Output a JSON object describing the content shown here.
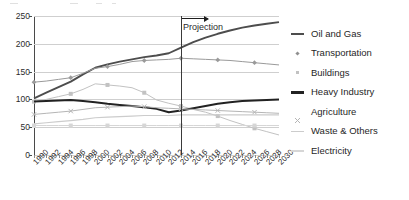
{
  "chart_data": {
    "type": "line",
    "title": "",
    "subtitle": "",
    "xlabel": "",
    "ylabel": "",
    "xlim": [
      1990,
      2030
    ],
    "ylim": [
      0,
      250
    ],
    "yticks": [
      0,
      50,
      100,
      150,
      200,
      250
    ],
    "grid": true,
    "legend_position": "right",
    "x": [
      1990,
      1992,
      1994,
      1996,
      1998,
      2000,
      2002,
      2004,
      2006,
      2008,
      2010,
      2012,
      2014,
      2016,
      2018,
      2020,
      2022,
      2024,
      2026,
      2028,
      2030
    ],
    "categories": [
      "1990",
      "1992",
      "1994",
      "1996",
      "1998",
      "2000",
      "2002",
      "2004",
      "2006",
      "2008",
      "2010",
      "2012",
      "2014",
      "2016",
      "2018",
      "2020",
      "2022",
      "2024",
      "2026",
      "2028",
      "2030"
    ],
    "annotations": [
      {
        "text": "Projection",
        "x": 2014,
        "type": "vertical-divider-with-arrow",
        "arrow_direction": "right"
      }
    ],
    "series": [
      {
        "name": "Oil and Gas",
        "marker": "none",
        "style": "line",
        "color": "#4d4d4d",
        "width": 1.9,
        "values": [
          102,
          112,
          122,
          132,
          145,
          157,
          163,
          168,
          172,
          176,
          179,
          183,
          193,
          203,
          211,
          218,
          224,
          229,
          233,
          236,
          239
        ]
      },
      {
        "name": "Transportation",
        "marker": "diamond",
        "style": "line-marker",
        "color": "#9a9a9a",
        "width": 1.0,
        "values": [
          131,
          133,
          136,
          139,
          147,
          156,
          159,
          163,
          168,
          170,
          171,
          172,
          174,
          173,
          172,
          171,
          170,
          168,
          166,
          164,
          162
        ]
      },
      {
        "name": "Buildings",
        "marker": "square",
        "style": "line-marker",
        "color": "#c2c2c2",
        "width": 1.0,
        "values": [
          96,
          100,
          105,
          110,
          118,
          128,
          126,
          124,
          121,
          112,
          99,
          93,
          88,
          82,
          77,
          70,
          62,
          55,
          48,
          42,
          36
        ]
      },
      {
        "name": "Heavy Industry",
        "marker": "none",
        "style": "line",
        "color": "#222222",
        "width": 2.0,
        "values": [
          96,
          97,
          98,
          99,
          97,
          95,
          92,
          90,
          88,
          86,
          83,
          77,
          80,
          84,
          88,
          92,
          95,
          97,
          98,
          99,
          100
        ]
      },
      {
        "name": "Agriculture",
        "marker": "cross",
        "style": "line-marker",
        "color": "#b5b5b5",
        "width": 1.0,
        "values": [
          73,
          75,
          77,
          79,
          82,
          85,
          86,
          87,
          88,
          87,
          85,
          84,
          83,
          82,
          81,
          80,
          79,
          78,
          77,
          76,
          75
        ]
      },
      {
        "name": "Waste & Others",
        "marker": "none",
        "style": "line",
        "color": "#cccccc",
        "width": 1.2,
        "values": [
          56,
          58,
          60,
          62,
          64,
          67,
          68,
          69,
          70,
          71,
          71,
          71,
          72,
          72,
          72,
          72,
          72,
          72,
          72,
          72,
          72
        ]
      },
      {
        "name": "Electricity",
        "marker": "square",
        "style": "line-marker",
        "color": "#d6d6d6",
        "width": 1.0,
        "values": [
          53,
          53,
          53,
          53,
          53,
          53,
          53,
          53,
          53,
          53,
          53,
          53,
          53,
          53,
          53,
          53,
          53,
          53,
          53,
          53,
          53
        ]
      }
    ]
  },
  "legend": {
    "items": [
      {
        "label": "Oil and Gas",
        "color": "#4d4d4d",
        "marker": "line-thick"
      },
      {
        "label": "Transportation",
        "color": "#8f8f8f",
        "marker": "diamond"
      },
      {
        "label": "Buildings",
        "color": "#c2c2c2",
        "marker": "square"
      },
      {
        "label": "Heavy Industry",
        "color": "#222222",
        "marker": "line-thick"
      },
      {
        "label": "Agriculture",
        "color": "#b5b5b5",
        "marker": "cross"
      },
      {
        "label": "Waste & Others",
        "color": "#cccccc",
        "marker": "line"
      },
      {
        "label": "Electricity",
        "color": "#d6d6d6",
        "marker": "line"
      }
    ]
  },
  "axes": {
    "y_tick_labels": [
      "250",
      "200",
      "150",
      "100",
      "50",
      "0"
    ],
    "x_tick_labels": [
      "1990",
      "1992",
      "1994",
      "1996",
      "1998",
      "2000",
      "2002",
      "2004",
      "2006",
      "2008",
      "2010",
      "2012",
      "2014",
      "2016",
      "2018",
      "2020",
      "2022",
      "2024",
      "2026",
      "2028",
      "2030"
    ]
  },
  "annotation": {
    "projection_label": "Projection"
  }
}
